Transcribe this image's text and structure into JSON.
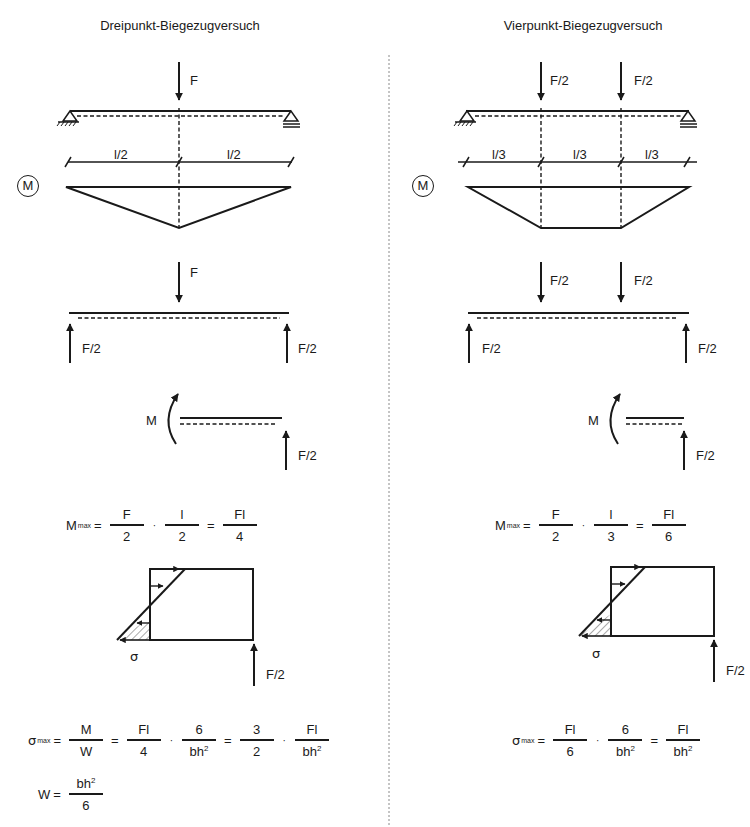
{
  "left": {
    "title": "Dreipunkt-Biegezugversuch",
    "load_label": "F",
    "span_labels": [
      "l/2",
      "l/2"
    ],
    "moment_symbol": "M",
    "fbd_load_label": "F",
    "reaction_labels": [
      "F/2",
      "F/2"
    ],
    "section_moment_label": "M",
    "section_reaction_label": "F/2",
    "mmax_formula": {
      "lhs": "M",
      "lhs_sub": "max",
      "eq": "=",
      "terms": [
        {
          "num": "F",
          "den": "2"
        },
        {
          "num": "l",
          "den": "2"
        }
      ],
      "result": {
        "num": "Fl",
        "den": "4"
      },
      "dot": "·"
    },
    "stress_label": "σ",
    "stress_reaction_label": "F/2",
    "sigma_formula": {
      "lhs": "σ",
      "lhs_sub": "max",
      "eq": "=",
      "t1": {
        "num": "M",
        "den": "W"
      },
      "t2": {
        "num": "Fl",
        "den": "4"
      },
      "t3": {
        "num": "6",
        "den": "bh",
        "den_sup": "2"
      },
      "t4": {
        "num": "3",
        "den": "2"
      },
      "t5": {
        "num": "Fl",
        "den": "bh",
        "den_sup": "2"
      },
      "dot": "·"
    },
    "w_formula": {
      "lhs": "W",
      "eq": "=",
      "num": "bh",
      "num_sup": "2",
      "den": "6"
    }
  },
  "right": {
    "title": "Vierpunkt-Biegezugversuch",
    "load_labels": [
      "F/2",
      "F/2"
    ],
    "span_labels": [
      "l/3",
      "l/3",
      "l/3"
    ],
    "moment_symbol": "M",
    "fbd_load_labels": [
      "F/2",
      "F/2"
    ],
    "reaction_labels": [
      "F/2",
      "F/2"
    ],
    "section_moment_label": "M",
    "section_reaction_label": "F/2",
    "mmax_formula": {
      "lhs": "M",
      "lhs_sub": "max",
      "eq": "=",
      "terms": [
        {
          "num": "F",
          "den": "2"
        },
        {
          "num": "l",
          "den": "3"
        }
      ],
      "result": {
        "num": "Fl",
        "den": "6"
      },
      "dot": "·"
    },
    "stress_label": "σ",
    "stress_reaction_label": "F/2",
    "sigma_formula": {
      "lhs": "σ",
      "lhs_sub": "max",
      "eq": "=",
      "t1": {
        "num": "Fl",
        "den": "6"
      },
      "t2": {
        "num": "6",
        "den": "bh",
        "den_sup": "2"
      },
      "t3": {
        "num": "Fl",
        "den": "bh",
        "den_sup": "2"
      },
      "dot": "·"
    }
  },
  "colors": {
    "ink": "#1a1a1a",
    "divider": "#8a8a8a",
    "hatch": "#555555",
    "background": "#ffffff"
  }
}
